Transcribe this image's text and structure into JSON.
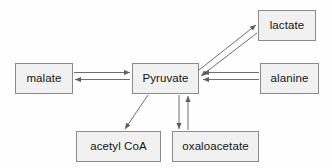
{
  "diagram": {
    "background_color": "#fefefe",
    "node_fill_color": "#f1f1f1",
    "node_border_color": "#8a8a8a",
    "arrow_color": "#6e6e6e",
    "text_color": "#141414",
    "nodes": [
      {
        "id": "malate",
        "label": "malate",
        "x": 15,
        "y": 63,
        "w": 58,
        "h": 31
      },
      {
        "id": "pyruvate",
        "label": "Pyruvate",
        "x": 132,
        "y": 63,
        "w": 67,
        "h": 31
      },
      {
        "id": "lactate",
        "label": "lactate",
        "x": 258,
        "y": 10,
        "w": 58,
        "h": 31
      },
      {
        "id": "alanine",
        "label": "alanine",
        "x": 260,
        "y": 63,
        "w": 59,
        "h": 31
      },
      {
        "id": "acetyl_coa",
        "label": "acetyl CoA",
        "x": 76,
        "y": 131,
        "w": 85,
        "h": 31
      },
      {
        "id": "oxaloacetate",
        "label": "oxaloacetate",
        "x": 172,
        "y": 131,
        "w": 87,
        "h": 31
      }
    ],
    "edges": [
      {
        "id": "malate-to-pyruvate",
        "from": "malate",
        "to": "pyruvate",
        "direction": "forward",
        "style": "straight-horizontal"
      },
      {
        "id": "pyruvate-to-malate",
        "from": "pyruvate",
        "to": "malate",
        "direction": "forward",
        "style": "straight-horizontal"
      },
      {
        "id": "pyruvate-to-lactate",
        "from": "pyruvate",
        "to": "lactate",
        "direction": "forward",
        "style": "diagonal"
      },
      {
        "id": "lactate-to-pyruvate",
        "from": "lactate",
        "to": "pyruvate",
        "direction": "forward",
        "style": "diagonal"
      },
      {
        "id": "alanine-to-pyruvate-a",
        "from": "alanine",
        "to": "pyruvate",
        "direction": "forward",
        "style": "straight-horizontal"
      },
      {
        "id": "alanine-to-pyruvate-b",
        "from": "alanine",
        "to": "pyruvate",
        "direction": "forward",
        "style": "straight-horizontal"
      },
      {
        "id": "pyruvate-to-acetylcoa",
        "from": "pyruvate",
        "to": "acetyl_coa",
        "direction": "forward",
        "style": "diagonal"
      },
      {
        "id": "pyruvate-to-oaa",
        "from": "pyruvate",
        "to": "oxaloacetate",
        "direction": "forward",
        "style": "straight-vertical"
      },
      {
        "id": "oaa-to-pyruvate",
        "from": "oxaloacetate",
        "to": "pyruvate",
        "direction": "forward",
        "style": "straight-vertical"
      }
    ]
  }
}
